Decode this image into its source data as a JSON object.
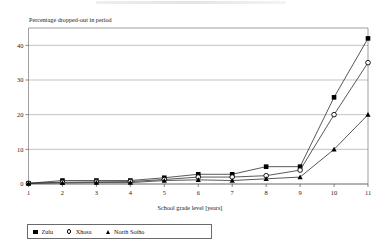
{
  "chart_data": {
    "type": "line",
    "title": "",
    "xlabel": "School grade level [years]",
    "ylabel": "Percentage dropped-out in period",
    "categories": [
      1,
      2,
      3,
      4,
      5,
      6,
      7,
      8,
      9,
      10,
      11
    ],
    "x": [
      1,
      2,
      3,
      4,
      5,
      6,
      7,
      8,
      9,
      10,
      11
    ],
    "xlim": [
      1,
      11
    ],
    "ylim": [
      0,
      45
    ],
    "xticks": [
      "1",
      "2",
      "3",
      "4",
      "5",
      "6",
      "7",
      "8",
      "9",
      "10",
      "11"
    ],
    "yticks": [
      "0",
      "10",
      "20",
      "30",
      "40"
    ],
    "ytick_values": [
      0,
      10,
      20,
      30,
      40
    ],
    "grid": "horizontal",
    "legend_position": "bottom-left",
    "series": [
      {
        "name": "Zulu",
        "marker": "filled-square",
        "values": [
          0.2,
          1.0,
          1.0,
          1.0,
          1.8,
          2.8,
          2.8,
          5.0,
          5.0,
          25.0,
          42.0
        ]
      },
      {
        "name": "Xhosa",
        "marker": "open-circle",
        "values": [
          0.2,
          0.5,
          0.6,
          0.7,
          1.3,
          2.0,
          2.0,
          2.4,
          4.0,
          20.0,
          35.0
        ]
      },
      {
        "name": "North Sotho",
        "marker": "filled-triangle",
        "values": [
          0.2,
          0.3,
          0.4,
          0.4,
          1.0,
          1.2,
          1.0,
          1.5,
          2.0,
          10.0,
          20.0
        ]
      }
    ]
  },
  "legend": {
    "items": [
      {
        "label": "Zulu",
        "marker": "filled-square"
      },
      {
        "label": "Xhosa",
        "marker": "open-circle"
      },
      {
        "label": "North Sotho",
        "marker": "filled-triangle"
      }
    ]
  }
}
